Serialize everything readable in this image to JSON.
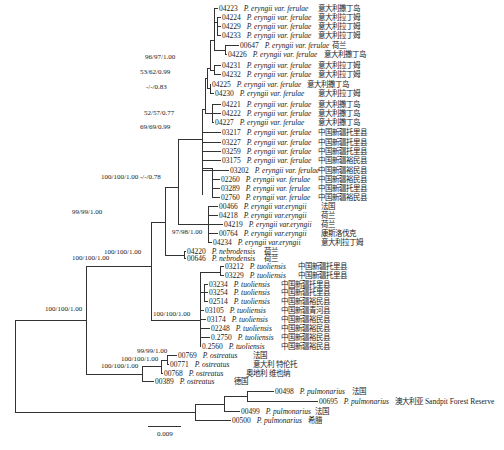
{
  "figure": {
    "scale_bar": "0.009",
    "leaves": [
      {
        "id": "04223",
        "species": "P. eryngii var. ferulae",
        "origin": "意大利撒丁岛",
        "x": 219,
        "y": 8,
        "locx": 318
      },
      {
        "id": "04224",
        "species": "P. eryngii var. ferulae",
        "origin": "意大利拉丁姆",
        "x": 222,
        "y": 17,
        "locx": 318
      },
      {
        "id": "04229",
        "species": "P. eryngii var. ferulae",
        "origin": "意大利拉丁姆",
        "x": 222,
        "y": 26,
        "locx": 318
      },
      {
        "id": "04233",
        "species": "P. eryngii var. ferulae",
        "origin": "意大利拉丁姆",
        "x": 222,
        "y": 35,
        "locx": 318
      },
      {
        "id": "00647",
        "species": "P. eryngii var. ferulae",
        "origin": "荷兰",
        "x": 240,
        "y": 45,
        "locx": 332
      },
      {
        "id": "04226",
        "species": "P. eryngii var. ferulae",
        "origin": "意大利撒丁岛",
        "x": 228,
        "y": 54,
        "locx": 324
      },
      {
        "id": "04231",
        "species": "P. eryngii var. ferulae",
        "origin": "意大利拉丁姆",
        "x": 222,
        "y": 65,
        "locx": 318
      },
      {
        "id": "04232",
        "species": "P. eryngii var. ferulae",
        "origin": "意大利拉丁姆",
        "x": 222,
        "y": 74,
        "locx": 318
      },
      {
        "id": "04225",
        "species": "P. eryngii var. ferulae",
        "origin": "意大利撒丁岛",
        "x": 212,
        "y": 84,
        "locx": 307
      },
      {
        "id": "04230",
        "species": "P. eryngii var. ferulae",
        "origin": "意大利拉丁姆",
        "x": 215,
        "y": 93,
        "locx": 318
      },
      {
        "id": "04221",
        "species": "P. eryngii var. ferulae",
        "origin": "意大利撒丁岛",
        "x": 222,
        "y": 104,
        "locx": 318
      },
      {
        "id": "04222",
        "species": "P. eryngii var. ferulae",
        "origin": "意大利撒丁岛",
        "x": 222,
        "y": 113,
        "locx": 318
      },
      {
        "id": "04227",
        "species": "P. eryngii var. ferulae",
        "origin": "意大利撒丁岛",
        "x": 215,
        "y": 122,
        "locx": 318
      },
      {
        "id": "03217",
        "species": "P. eryngii var. ferulae",
        "origin": "中国新疆托里县",
        "x": 222,
        "y": 132,
        "locx": 318
      },
      {
        "id": "03227",
        "species": "P. eryngii var. ferulae",
        "origin": "中国新疆托里县",
        "x": 222,
        "y": 142,
        "locx": 318
      },
      {
        "id": "03259",
        "species": "P. eryngii var. ferulae",
        "origin": "中国新疆托里县",
        "x": 222,
        "y": 151,
        "locx": 318
      },
      {
        "id": "03175",
        "species": "P. eryngii var. ferulae",
        "origin": "中国新疆裕民县",
        "x": 222,
        "y": 160,
        "locx": 318
      },
      {
        "id": "03202",
        "species": "P. eryngii var. ferulae",
        "origin": "中国新疆裕民县",
        "x": 230,
        "y": 170,
        "locx": 318
      },
      {
        "id": "02260",
        "species": "P. eryngii var. ferulae",
        "origin": "中国新疆裕民县",
        "x": 221,
        "y": 179,
        "locx": 318
      },
      {
        "id": "03289",
        "species": "P. eryngii var. ferulae",
        "origin": "中国新疆托里县",
        "x": 221,
        "y": 188,
        "locx": 318
      },
      {
        "id": "02760",
        "species": "P. eryngii var. ferulae",
        "origin": "中国新疆裕民县",
        "x": 221,
        "y": 197,
        "locx": 318
      },
      {
        "id": "00466",
        "species": "P. eryngii var.eryngii",
        "origin": "法国",
        "x": 219,
        "y": 206,
        "locx": 321
      },
      {
        "id": "04218",
        "species": "P. eryngii var.eryngii",
        "origin": "荷兰",
        "x": 219,
        "y": 215,
        "locx": 321
      },
      {
        "id": "04219",
        "species": "P. eryngii var.eryngii",
        "origin": "荷兰",
        "x": 224,
        "y": 224,
        "locx": 321
      },
      {
        "id": "00764",
        "species": "P. eryngii var.eryngii",
        "origin": "康斯洛伐克",
        "x": 219,
        "y": 233,
        "locx": 321
      },
      {
        "id": "04234",
        "species": "P. eryngii var.eryngii",
        "origin": "意大利拉丁姆",
        "x": 213,
        "y": 242,
        "locx": 321
      },
      {
        "id": "04220",
        "species": "P. nebrodensis",
        "origin": "荷兰",
        "x": 187,
        "y": 251,
        "locx": 264
      },
      {
        "id": "00646",
        "species": "P. nebrodensis",
        "origin": "荷兰",
        "x": 187,
        "y": 258,
        "locx": 264
      },
      {
        "id": "03212",
        "species": "P. tuoliensis",
        "origin": "中国新疆托里县",
        "x": 225,
        "y": 266,
        "locx": 298
      },
      {
        "id": "03229",
        "species": "P. tuoliensis",
        "origin": "中国新疆托里县",
        "x": 225,
        "y": 275,
        "locx": 298
      },
      {
        "id": "03234",
        "species": "P. tuoliensis",
        "origin": "中国新疆托里县",
        "x": 209,
        "y": 284,
        "locx": 281
      },
      {
        "id": "03254",
        "species": "P. tuoliensis",
        "origin": "中国新疆托里县",
        "x": 209,
        "y": 292,
        "locx": 281
      },
      {
        "id": "02514",
        "species": "P. tuoliensis",
        "origin": "中国新疆裕民县",
        "x": 209,
        "y": 301,
        "locx": 281
      },
      {
        "id": "03105",
        "species": "P. tuoliensis",
        "origin": "中国新疆青河县",
        "x": 205,
        "y": 310,
        "locx": 281
      },
      {
        "id": "03174",
        "species": "P. tuoliensis",
        "origin": "中国新疆裕民县",
        "x": 207,
        "y": 319,
        "locx": 281
      },
      {
        "id": "02248",
        "species": "P. tuoliensis",
        "origin": "中国新疆裕民县",
        "x": 211,
        "y": 328,
        "locx": 281
      },
      {
        "id": "0.2750",
        "species": "P. tuoliensis",
        "origin": "中国新疆裕民县",
        "x": 211,
        "y": 337,
        "locx": 281
      },
      {
        "id": "0.2560",
        "species": "P. tuoliensis",
        "origin": "中国新疆裕民县",
        "x": 202,
        "y": 346,
        "locx": 281
      },
      {
        "id": "00769",
        "species": "P. ostreatus",
        "origin": "法国",
        "x": 178,
        "y": 355,
        "locx": 253
      },
      {
        "id": "00771",
        "species": "P. ostreatus",
        "origin": "意大利 特伦托",
        "x": 170,
        "y": 364,
        "locx": 253
      },
      {
        "id": "00768",
        "species": "P. ostreatus",
        "origin": "奥地利 维也纳",
        "x": 164,
        "y": 373,
        "locx": 246
      },
      {
        "id": "00389",
        "species": "P. ostreatus",
        "origin": "德国",
        "x": 155,
        "y": 381,
        "locx": 234
      },
      {
        "id": "00498",
        "species": "P. pulmonarius",
        "origin": "法国",
        "x": 275,
        "y": 391,
        "locx": 352
      },
      {
        "id": "00695",
        "species": "P. pulmonarius",
        "origin": "澳大利亚 Sandpit Forest Reserve",
        "x": 319,
        "y": 401,
        "locx": 395
      },
      {
        "id": "00499",
        "species": "P. pulmonarius",
        "origin": "法国",
        "x": 241,
        "y": 411,
        "locx": 315
      },
      {
        "id": "00500",
        "species": "P. pulmonarius",
        "origin": "希腊",
        "x": 232,
        "y": 420,
        "locx": 308
      }
    ],
    "supports": [
      {
        "label": "96/97/1.00",
        "x": 145,
        "y": 61
      },
      {
        "label": "53/62/0.99",
        "x": 140,
        "y": 76
      },
      {
        "label": "-/-/0.83",
        "x": 146,
        "y": 91
      },
      {
        "label": "52/57/0.77",
        "x": 144,
        "y": 117
      },
      {
        "label": "69/69/0.99",
        "x": 140,
        "y": 131
      },
      {
        "label": "100/100/1.00 -/-/0.78",
        "x": 101,
        "y": 181
      },
      {
        "label": "99/99/1.00",
        "x": 72,
        "y": 216
      },
      {
        "label": "97/98/1.00",
        "x": 172,
        "y": 236
      },
      {
        "label": "100/100/1.00",
        "x": 104,
        "y": 256
      },
      {
        "label": "100/100/1.00",
        "x": 72,
        "y": 262
      },
      {
        "label": "100/100/1.00",
        "x": 45,
        "y": 313
      },
      {
        "label": "100/100/1.00",
        "x": 153,
        "y": 318
      },
      {
        "label": "99/99/1.00",
        "x": 137,
        "y": 355
      },
      {
        "label": "100/100/1.00",
        "x": 121,
        "y": 363
      },
      {
        "label": "100/100/1.00",
        "x": 101,
        "y": 370
      }
    ]
  }
}
